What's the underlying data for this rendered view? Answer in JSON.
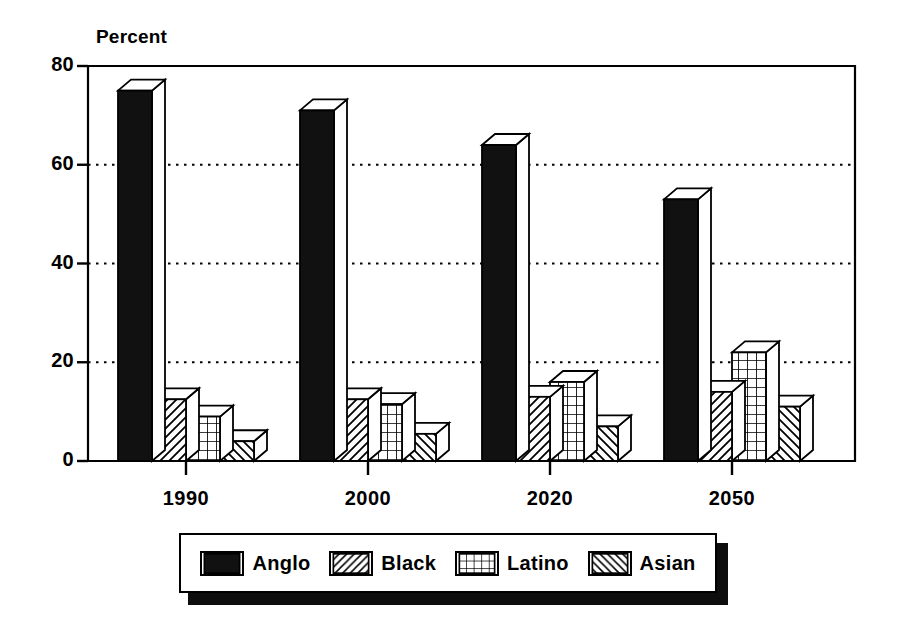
{
  "chart_data": {
    "type": "bar",
    "title": "",
    "subtitle": "",
    "ylabel": "Percent",
    "xlabel": "",
    "categories": [
      "1990",
      "2000",
      "2020",
      "2050"
    ],
    "ylim": [
      0,
      80
    ],
    "yticks": [
      0,
      20,
      40,
      60,
      80
    ],
    "ytick_labels": [
      "0",
      "20",
      "40",
      "60",
      "80"
    ],
    "grid": true,
    "grid_style": "dotted-horizontal",
    "legend_position": "bottom",
    "style_3d": true,
    "series": [
      {
        "name": "Anglo",
        "pattern": "solid-black",
        "swatch_icon": "solid-fill-swatch",
        "values": [
          75,
          71,
          64,
          53
        ]
      },
      {
        "name": "Black",
        "pattern": "forward-diagonal",
        "swatch_icon": "diagonal-hatch-swatch",
        "values": [
          12.5,
          12.5,
          13,
          14
        ]
      },
      {
        "name": "Latino",
        "pattern": "grid-crosshatch",
        "swatch_icon": "grid-hatch-swatch",
        "values": [
          9,
          11.5,
          16,
          22
        ]
      },
      {
        "name": "Asian",
        "pattern": "backward-diagonal",
        "swatch_icon": "reverse-diagonal-hatch-swatch",
        "values": [
          4,
          5.5,
          7,
          11
        ]
      }
    ]
  },
  "colors": {
    "ink": "#000000",
    "background": "#ffffff",
    "bar_fill": "#ffffff",
    "anglo_fill": "#111111",
    "grid": "#000000",
    "legend_shadow": "#0d0d0d"
  },
  "legend": {
    "items": [
      {
        "label": "Anglo"
      },
      {
        "label": "Black"
      },
      {
        "label": "Latino"
      },
      {
        "label": "Asian"
      }
    ]
  }
}
